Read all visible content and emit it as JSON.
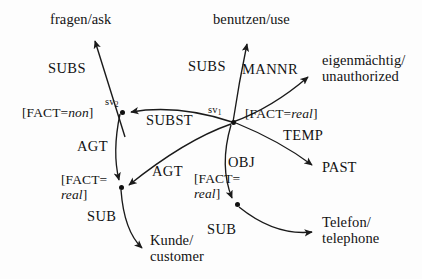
{
  "diagram": {
    "kind": "semantic-network",
    "width": 422,
    "height": 279,
    "background_color": "#fdfdfd",
    "stroke_color": "#1a1a1a",
    "text_color": "#131313",
    "nodes": [
      {
        "id": "fragen",
        "label": "fragen/ask",
        "x": 50,
        "y": 12,
        "type": "concept"
      },
      {
        "id": "benutzen",
        "label": "benutzen/use",
        "x": 213,
        "y": 12,
        "type": "concept"
      },
      {
        "id": "eigenmaechtig",
        "label_line1": "eigenmächtig/",
        "label_line2": "unauthorized",
        "x": 322,
        "y": 52,
        "type": "concept"
      },
      {
        "id": "past",
        "label": "PAST",
        "x": 322,
        "y": 160,
        "type": "concept"
      },
      {
        "id": "telefon",
        "label_line1": "Telefon/",
        "label_line2": "telephone",
        "x": 322,
        "y": 214,
        "type": "concept"
      },
      {
        "id": "kunde",
        "label_line1": "Kunde/",
        "label_line2": "customer",
        "x": 150,
        "y": 232,
        "type": "concept"
      },
      {
        "id": "sv2",
        "label": "sv",
        "sub": "2",
        "x": 122,
        "y": 112,
        "type": "variable-node"
      },
      {
        "id": "sv1",
        "label": "sv",
        "sub": "1",
        "x": 233,
        "y": 122,
        "type": "variable-node"
      },
      {
        "id": "agent-node",
        "x": 121,
        "y": 187,
        "type": "variable-node"
      },
      {
        "id": "object-node",
        "x": 237,
        "y": 204,
        "type": "variable-node"
      }
    ],
    "features": [
      {
        "id": "fact-non-sv2",
        "prefix": "[FACT=",
        "value": "non",
        "suffix": "]",
        "x": 22,
        "y": 106
      },
      {
        "id": "fact-real-sv1",
        "prefix": "[FACT=",
        "value": "real",
        "suffix": "]",
        "x": 245,
        "y": 107
      },
      {
        "id": "fact-real-agent",
        "prefix": "[FACT=",
        "value": "real",
        "suffix": "]",
        "x": 61,
        "y": 173,
        "wrap": true
      },
      {
        "id": "fact-real-obj",
        "prefix": "[FACT=",
        "value": "real",
        "suffix": "]",
        "x": 194,
        "y": 172,
        "wrap": true
      }
    ],
    "edges": [
      {
        "id": "subs-left",
        "label": "SUBS",
        "label_x": 48,
        "label_y": 61,
        "from": "sv2",
        "to": "fragen",
        "arrow": true
      },
      {
        "id": "subs-right",
        "label": "SUBS",
        "label_x": 188,
        "label_y": 59,
        "from": "sv1",
        "to": "benutzen",
        "arrow": true
      },
      {
        "id": "mannr",
        "label": "MANNR",
        "label_x": 242,
        "label_y": 62,
        "from": "sv1",
        "to": "eigenmaechtig",
        "arrow": true
      },
      {
        "id": "subst",
        "label": "SUBST",
        "label_x": 146,
        "label_y": 113,
        "from": "sv1",
        "to": "sv2",
        "arrow": true
      },
      {
        "id": "temp",
        "label": "TEMP",
        "label_x": 283,
        "label_y": 128,
        "from": "sv1",
        "to": "past",
        "arrow": true
      },
      {
        "id": "agt-left",
        "label": "AGT",
        "label_x": 77,
        "label_y": 139,
        "from": "sv2",
        "to": "agent-node",
        "arrow": true
      },
      {
        "id": "agt-right",
        "label": "AGT",
        "label_x": 152,
        "label_y": 164,
        "from": "sv1",
        "to": "agent-node",
        "arrow": true
      },
      {
        "id": "obj",
        "label": "OBJ",
        "label_x": 228,
        "label_y": 155,
        "from": "sv1",
        "to": "object-node",
        "arrow": true
      },
      {
        "id": "sub-left",
        "label": "SUB",
        "label_x": 87,
        "label_y": 209,
        "from": "agent-node",
        "to": "kunde",
        "arrow": true
      },
      {
        "id": "sub-right",
        "label": "SUB",
        "label_x": 207,
        "label_y": 222,
        "from": "object-node",
        "to": "telefon",
        "arrow": true
      }
    ]
  }
}
